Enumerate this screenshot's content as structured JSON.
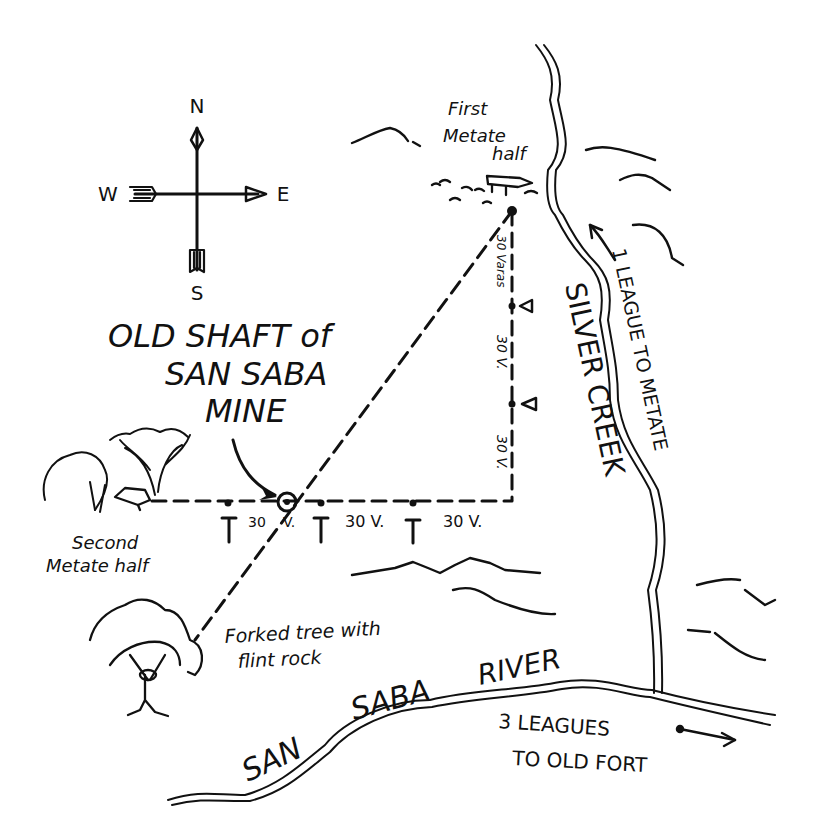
{
  "map": {
    "title": "OLD SHAFT of SAN SABA MINE",
    "title_lines": [
      "OLD SHAFT of",
      "SAN SABA",
      "MINE"
    ],
    "ink_color": "#111111",
    "paper_color": "#ffffff",
    "compass": {
      "north": "N",
      "south": "S",
      "east": "E",
      "west": "W"
    },
    "landmarks": {
      "first_metate": [
        "First",
        "Metate",
        "half"
      ],
      "second_metate": [
        "Second",
        "Metate half"
      ],
      "forked_tree": [
        "Forked tree with",
        "flint rock"
      ]
    },
    "distances": {
      "vertical": [
        "30 Varas",
        "30 V.",
        "30 V."
      ],
      "horizontal": [
        "30",
        "V.",
        "30 V.",
        "30 V."
      ]
    },
    "waterways": {
      "creek": "SILVER CREEK",
      "river": [
        "SAN",
        "SABA",
        "RIVER"
      ]
    },
    "directions": {
      "to_metate": "1 LEAGUE TO METATE",
      "to_fort": [
        "3 LEAGUES",
        "TO OLD FORT"
      ]
    }
  }
}
